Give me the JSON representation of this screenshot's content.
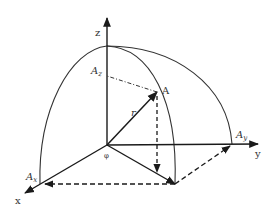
{
  "diagram": {
    "type": "3d-coordinate-vector",
    "axes": {
      "x_label": "x",
      "y_label": "y",
      "z_label": "z"
    },
    "vector": {
      "point_label": "A",
      "radius_label": "r",
      "angle_label": "φ"
    },
    "components": {
      "Ax": {
        "base": "A",
        "sub": "x"
      },
      "Ay": {
        "base": "A",
        "sub": "y"
      },
      "Az": {
        "base": "A",
        "sub": "z"
      }
    },
    "colors": {
      "stroke": "#1a1a1a",
      "background": "#ffffff"
    }
  }
}
